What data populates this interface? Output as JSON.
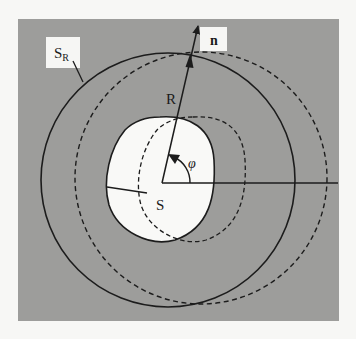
{
  "diagram": {
    "colors": {
      "page_background": "#f7f7f5",
      "panel_background": "#9d9d9b",
      "region_fill": "#f9f9f7",
      "stroke": "#1c1c1c",
      "label_box": "#f6f6f4"
    },
    "labels": {
      "outer_surface": "S",
      "outer_surface_subscript": "R",
      "normal_vector": "n",
      "radius": "R",
      "angle": "φ",
      "inner_region": "S"
    },
    "elements": {
      "outer_circle_solid": {
        "cx": 168,
        "cy": 180,
        "r": 127,
        "style": "solid"
      },
      "outer_circle_dashed": {
        "cx": 201,
        "cy": 178,
        "r": 127,
        "style": "dashed"
      },
      "inner_region_solid": {
        "style": "solid",
        "fill": "white"
      },
      "inner_region_dashed": {
        "style": "dashed"
      },
      "origin": {
        "x": 162,
        "y": 183
      },
      "radial_vector_tip": {
        "x": 198,
        "y": 25
      },
      "horizontal_axis_end": {
        "x": 338,
        "y": 183
      }
    }
  }
}
